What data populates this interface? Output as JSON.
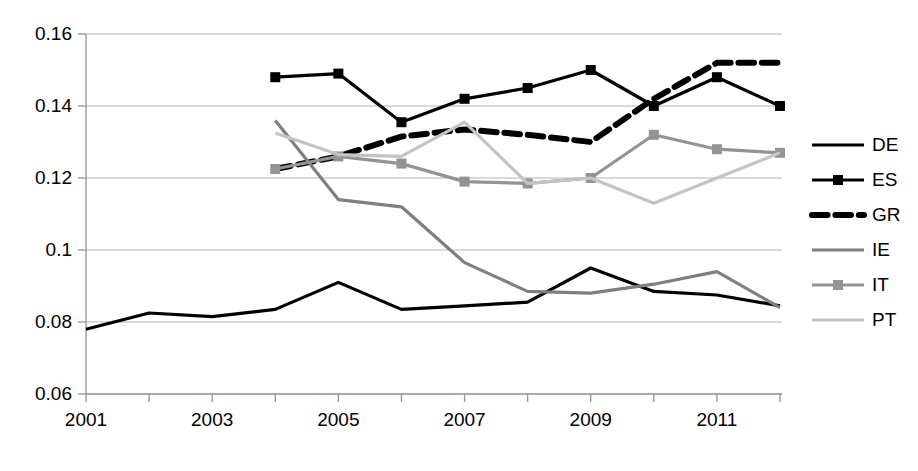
{
  "chart_data": {
    "type": "line",
    "title": "",
    "xlabel": "",
    "ylabel": "",
    "x": [
      2001,
      2002,
      2003,
      2004,
      2005,
      2006,
      2007,
      2008,
      2009,
      2010,
      2011,
      2012
    ],
    "xlim": [
      2001,
      2012
    ],
    "ylim": [
      0.06,
      0.16
    ],
    "yticks": [
      0.06,
      0.08,
      0.1,
      0.12,
      0.14,
      0.16
    ],
    "ytick_labels": [
      "0.06",
      "0.08",
      "0.1",
      "0.12",
      "0.14",
      "0.16"
    ],
    "xticks": [
      2001,
      2002,
      2003,
      2004,
      2005,
      2006,
      2007,
      2008,
      2009,
      2010,
      2011,
      2012
    ],
    "xtick_labels": [
      "2001",
      "",
      "2003",
      "",
      "2005",
      "",
      "2007",
      "",
      "2009",
      "",
      "2011",
      ""
    ],
    "grid": "horizontal",
    "legend_position": "right",
    "series": [
      {
        "name": "DE",
        "color": "#000000",
        "width": 3.2,
        "dash": "none",
        "marker": "none",
        "x": [
          2001,
          2002,
          2003,
          2004,
          2005,
          2006,
          2007,
          2008,
          2009,
          2010,
          2011,
          2012
        ],
        "values": [
          0.078,
          0.0825,
          0.0815,
          0.0835,
          0.091,
          0.0835,
          0.0845,
          0.0855,
          0.095,
          0.0885,
          0.0875,
          0.0845
        ]
      },
      {
        "name": "ES",
        "color": "#000000",
        "width": 3.2,
        "dash": "none",
        "marker": "square",
        "x": [
          2004,
          2005,
          2006,
          2007,
          2008,
          2009,
          2010,
          2011,
          2012
        ],
        "values": [
          0.148,
          0.149,
          0.1355,
          0.142,
          0.145,
          0.15,
          0.14,
          0.148,
          0.14
        ]
      },
      {
        "name": "GR",
        "color": "#000000",
        "width": 6.0,
        "dash": "dashed",
        "marker": "none",
        "x": [
          2004,
          2005,
          2006,
          2007,
          2008,
          2009,
          2010,
          2011,
          2012
        ],
        "values": [
          0.1225,
          0.126,
          0.1315,
          0.1335,
          0.132,
          0.13,
          0.142,
          0.152,
          0.152
        ]
      },
      {
        "name": "IE",
        "color": "#7f7f7f",
        "width": 3.2,
        "dash": "none",
        "marker": "none",
        "x": [
          2004,
          2005,
          2006,
          2007,
          2008,
          2009,
          2010,
          2011,
          2012
        ],
        "values": [
          0.136,
          0.114,
          0.112,
          0.0965,
          0.0885,
          0.088,
          0.0905,
          0.094,
          0.084
        ]
      },
      {
        "name": "IT",
        "color": "#939393",
        "width": 3.2,
        "dash": "none",
        "marker": "square",
        "x": [
          2004,
          2005,
          2006,
          2007,
          2008,
          2009,
          2010,
          2011,
          2012
        ],
        "values": [
          0.1225,
          0.126,
          0.124,
          0.119,
          0.1185,
          0.12,
          0.132,
          0.128,
          0.127
        ]
      },
      {
        "name": "PT",
        "color": "#c4c4c4",
        "width": 3.2,
        "dash": "none",
        "marker": "none",
        "x": [
          2004,
          2005,
          2006,
          2007,
          2008,
          2009,
          2010,
          2011,
          2012
        ],
        "values": [
          0.1325,
          0.1265,
          0.126,
          0.1355,
          0.1185,
          0.12,
          0.113,
          0.12,
          0.127
        ]
      }
    ]
  },
  "legend": {
    "entries": [
      {
        "label": "DE"
      },
      {
        "label": "ES"
      },
      {
        "label": "GR"
      },
      {
        "label": "IE"
      },
      {
        "label": "IT"
      },
      {
        "label": "PT"
      }
    ]
  }
}
